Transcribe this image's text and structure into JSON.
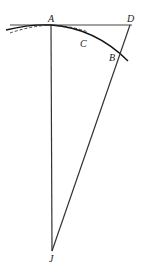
{
  "diagram": {
    "type": "geometry",
    "points": {
      "A": {
        "label": "A",
        "x": 51,
        "y": 25
      },
      "D": {
        "label": "D",
        "x": 130,
        "y": 25
      },
      "B": {
        "label": "B",
        "x": 119,
        "y": 54
      },
      "C": {
        "label": "C",
        "x": 84,
        "y": 39
      },
      "J": {
        "label": "J",
        "x": 52,
        "y": 251
      }
    },
    "labels": {
      "A": "A",
      "D": "D",
      "C": "C",
      "B": "B",
      "J": "J"
    },
    "elements": [
      "tangent line through A to D",
      "arc of circle through A, C, B",
      "dashed arc approximation near A",
      "radius AJ",
      "line DJ through B"
    ],
    "colors": {
      "stroke": "#222222",
      "background": "#ffffff"
    }
  }
}
